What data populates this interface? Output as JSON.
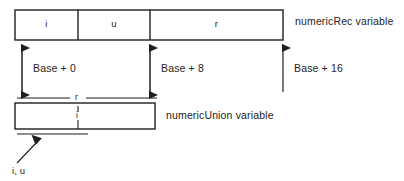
{
  "figure": {
    "type": "memory-layout-diagram",
    "colors": {
      "line": "#1f1f1f",
      "text": "#242424",
      "background": "#ffffff"
    }
  },
  "record": {
    "label": "numericRec variable",
    "fields": [
      {
        "name": "i",
        "x": 15,
        "width": 63
      },
      {
        "name": "u",
        "x": 78,
        "width": 72
      },
      {
        "name": "r",
        "x": 150,
        "width": 133
      }
    ]
  },
  "offsets": [
    {
      "label": "Base + 0",
      "x": 22,
      "arrow": "double"
    },
    {
      "label": "Base + 8",
      "x": 150,
      "arrow": "double"
    },
    {
      "label": "Base + 16",
      "x": 283,
      "arrow": "single-up"
    }
  ],
  "union": {
    "label": "numericUnion variable",
    "top_bracket_label": "r",
    "inner_tick_label": "i",
    "callout_label": "i, u"
  }
}
